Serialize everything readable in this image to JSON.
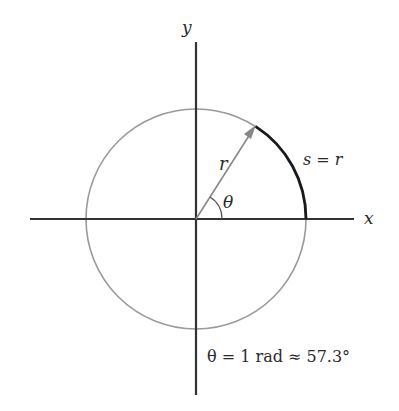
{
  "diagram": {
    "type": "unit-circle-radian-definition",
    "axes": {
      "x_label": "x",
      "y_label": "y"
    },
    "labels": {
      "radius": "r",
      "angle": "θ",
      "arc": "s = r",
      "caption": "θ = 1 rad ≈ 57.3°"
    },
    "geometry": {
      "origin": [
        196,
        219
      ],
      "radius_px": 110,
      "angle_deg": 57.3
    },
    "colors": {
      "axis": "#333333",
      "circle": "#999999",
      "arc": "#1a1a1a",
      "radius_arrow": "#888888",
      "text": "#2a2a2a"
    }
  }
}
